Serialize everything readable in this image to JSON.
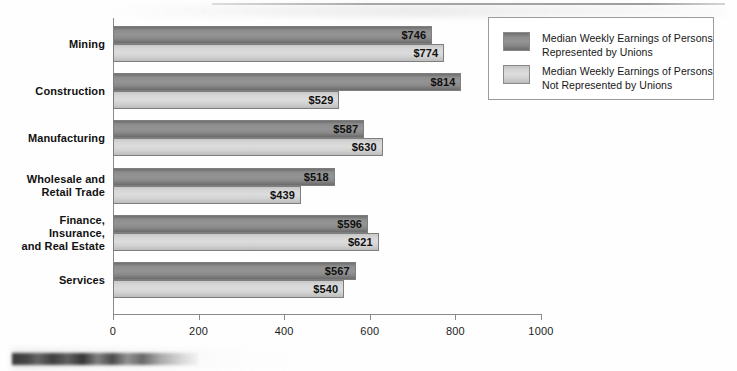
{
  "chart_data": {
    "type": "bar",
    "orientation": "horizontal",
    "title": "",
    "xlabel": "",
    "ylabel": "",
    "xlim": [
      0,
      1000
    ],
    "xticks": [
      "0",
      "200",
      "400",
      "600",
      "800",
      "1000"
    ],
    "xtick_values": [
      0,
      200,
      400,
      600,
      800,
      1000
    ],
    "grid": false,
    "legend_position": "top-right",
    "categories": [
      "Mining",
      "Construction",
      "Manufacturing",
      "Wholesale and\nRetail Trade",
      "Finance,\nInsurance,\nand Real Estate",
      "Services"
    ],
    "series": [
      {
        "name": "Median Weekly Earnings of Persons\nRepresented by Unions",
        "color": "#8e8e8e",
        "values": [
          746,
          814,
          587,
          518,
          596,
          567
        ],
        "labels": [
          "$746",
          "$814",
          "$587",
          "$518",
          "$596",
          "$567"
        ]
      },
      {
        "name": "Median Weekly Earnings of Persons\nNot Represented by Unions",
        "color": "#d6d6d6",
        "values": [
          774,
          529,
          630,
          439,
          621,
          540
        ],
        "labels": [
          "$774",
          "$529",
          "$630",
          "$439",
          "$621",
          "$540"
        ]
      }
    ]
  },
  "legend": {
    "items": [
      {
        "label": "Median Weekly Earnings of Persons\nRepresented by Unions",
        "swatch": "union"
      },
      {
        "label": "Median Weekly Earnings of Persons\nNot Represented by Unions",
        "swatch": "nonunion"
      }
    ]
  },
  "axis": {
    "ticks": [
      {
        "label": "0",
        "value": 0
      },
      {
        "label": "200",
        "value": 200
      },
      {
        "label": "400",
        "value": 400
      },
      {
        "label": "600",
        "value": 600
      },
      {
        "label": "800",
        "value": 800
      },
      {
        "label": "1000",
        "value": 1000
      }
    ]
  }
}
